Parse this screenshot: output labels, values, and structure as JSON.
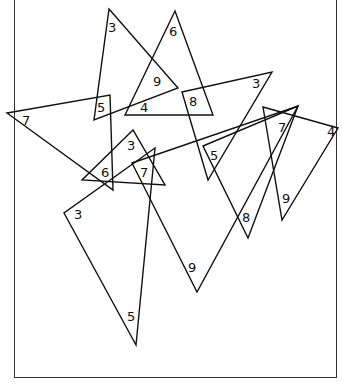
{
  "puzzle": {
    "caption": "",
    "frame": {
      "left": 14,
      "right": 336,
      "bottom": 378
    },
    "triangles": [
      {
        "id": "t1",
        "points": [
          [
            109,
            9
          ],
          [
            178,
            88
          ],
          [
            94,
            120
          ]
        ],
        "labels": [
          {
            "text": "3",
            "x": 108,
            "y": 32
          },
          {
            "text": "9",
            "x": 153,
            "y": 86
          },
          {
            "text": "5",
            "x": 97,
            "y": 112
          }
        ]
      },
      {
        "id": "t2",
        "points": [
          [
            175,
            11
          ],
          [
            125,
            115
          ],
          [
            213,
            115
          ]
        ],
        "labels": [
          {
            "text": "6",
            "x": 169,
            "y": 36
          },
          {
            "text": "4",
            "x": 140,
            "y": 112
          }
        ]
      },
      {
        "id": "t3",
        "points": [
          [
            7,
            113
          ],
          [
            110,
            95
          ],
          [
            113,
            190
          ]
        ],
        "labels": [
          {
            "text": "7",
            "x": 22,
            "y": 125
          }
        ]
      },
      {
        "id": "t4",
        "points": [
          [
            133,
            130
          ],
          [
            82,
            180
          ],
          [
            165,
            185
          ]
        ],
        "labels": [
          {
            "text": "3",
            "x": 127,
            "y": 150
          },
          {
            "text": "6",
            "x": 101,
            "y": 177
          }
        ]
      },
      {
        "id": "t5",
        "points": [
          [
            155,
            148
          ],
          [
            64,
            213
          ],
          [
            136,
            345
          ]
        ],
        "labels": [
          {
            "text": "7",
            "x": 140,
            "y": 177
          },
          {
            "text": "3",
            "x": 74,
            "y": 219
          },
          {
            "text": "5",
            "x": 127,
            "y": 321
          }
        ]
      },
      {
        "id": "t6",
        "points": [
          [
            132,
            163
          ],
          [
            298,
            106
          ],
          [
            197,
            292
          ]
        ],
        "labels": [
          {
            "text": "9",
            "x": 188,
            "y": 272
          }
        ]
      },
      {
        "id": "t7",
        "points": [
          [
            182,
            92
          ],
          [
            272,
            72
          ],
          [
            208,
            180
          ]
        ],
        "labels": [
          {
            "text": "8",
            "x": 189,
            "y": 106
          },
          {
            "text": "3",
            "x": 252,
            "y": 88
          },
          {
            "text": "5",
            "x": 210,
            "y": 160
          }
        ]
      },
      {
        "id": "t8",
        "points": [
          [
            203,
            146
          ],
          [
            298,
            106
          ],
          [
            248,
            238
          ]
        ],
        "labels": [
          {
            "text": "7",
            "x": 278,
            "y": 132
          },
          {
            "text": "8",
            "x": 242,
            "y": 222
          }
        ]
      },
      {
        "id": "t9",
        "points": [
          [
            263,
            107
          ],
          [
            338,
            128
          ],
          [
            282,
            220
          ]
        ],
        "labels": [
          {
            "text": "4",
            "x": 327,
            "y": 136
          },
          {
            "text": "9",
            "x": 282,
            "y": 203
          }
        ]
      }
    ]
  }
}
